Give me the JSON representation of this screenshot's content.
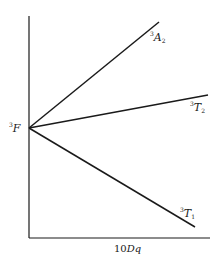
{
  "diagram": {
    "type": "orgel-splitting",
    "axes": {
      "x_label_prefix": "10",
      "x_label_var": "Dq",
      "origin": [
        29,
        238
      ],
      "y_top": 16,
      "x_right": 210
    },
    "origin_term": {
      "sup": "3",
      "letter": "F",
      "point": [
        29,
        128
      ]
    },
    "lines": [
      {
        "id": "A2",
        "sup": "3",
        "letter": "A",
        "sub": "2",
        "end": [
          159,
          22
        ]
      },
      {
        "id": "T2",
        "sup": "3",
        "letter": "T",
        "sub": "2",
        "end": [
          208,
          95
        ]
      },
      {
        "id": "T1",
        "sup": "3",
        "letter": "T",
        "sub": "1",
        "end": [
          195,
          227
        ]
      }
    ],
    "colors": {
      "ink": "#1a1a1a",
      "background": "#ffffff"
    }
  }
}
